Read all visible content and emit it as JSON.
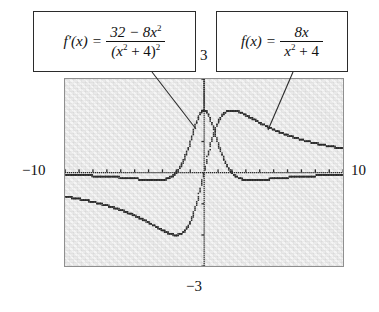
{
  "figure": {
    "background_color": "#ffffff",
    "plot_background_color": "#e9e9e9",
    "plot_border_color": "#8f8f8f",
    "curve_color": "#2b2b2b",
    "callout_border_color": "#2b2b2b"
  },
  "callouts": {
    "fprime": {
      "lhs": "f′(x)",
      "equals": "=",
      "numerator_pre": "32 − 8x",
      "numerator_exp": "2",
      "denominator_open": "(x",
      "denominator_exp_inner": "2",
      "denominator_mid": " + 4)",
      "denominator_exp_outer": "2",
      "plain_text": "f′(x) = (32 − 8x²) / (x² + 4)²"
    },
    "f": {
      "lhs": "f(x)",
      "equals": "=",
      "numerator_pre": "8x",
      "denominator_open": "x",
      "denominator_exp_inner": "2",
      "denominator_mid": " + 4",
      "plain_text": "f(x) = 8x / (x² + 4)"
    }
  },
  "axis_labels": {
    "ymax": "3",
    "xmin": "−10",
    "xmax": "10",
    "ymin": "−3"
  },
  "chart_data": {
    "type": "line",
    "title": "",
    "subtitle": "",
    "xlabel": "",
    "ylabel": "",
    "xlim": [
      -10,
      10
    ],
    "ylim": [
      -3,
      3
    ],
    "grid": false,
    "legend_position": "callout-boxes",
    "axes_style": "dotted-graphing-calculator",
    "x_axis_ticks_interval": 1,
    "y_axis_ticks_interval": 1,
    "annotations": [
      "f′(x) = (32 − 8x²)/(x² + 4)²",
      "f(x) = 8x/(x² + 4)"
    ],
    "series": [
      {
        "name": "f(x) = 8x/(x^2 + 4)",
        "formula": "8*x/(x*x+4)",
        "style": "dotted",
        "color": "#2b2b2b",
        "key_points": {
          "maximum": {
            "x": 2,
            "y": 2
          },
          "minimum": {
            "x": -2,
            "y": -2
          },
          "zero": {
            "x": 0,
            "y": 0
          }
        },
        "x": [
          -10,
          -9,
          -8,
          -7,
          -6,
          -5,
          -4,
          -3,
          -2,
          -1,
          0,
          1,
          2,
          3,
          4,
          5,
          6,
          7,
          8,
          9,
          10
        ],
        "values": [
          -0.769,
          -0.847,
          -0.941,
          -1.057,
          -1.2,
          -1.379,
          -1.6,
          -1.846,
          -2.0,
          -1.6,
          0.0,
          1.6,
          2.0,
          1.846,
          1.6,
          1.379,
          1.2,
          1.057,
          0.941,
          0.847,
          0.769
        ]
      },
      {
        "name": "f'(x) = (32 - 8x^2)/(x^2 + 4)^2",
        "formula": "(32-8*x*x)/((x*x+4)*(x*x+4))",
        "style": "dotted",
        "color": "#2b2b2b",
        "key_points": {
          "maximum": {
            "x": 0,
            "y": 2
          },
          "zeros": [
            {
              "x": -2,
              "y": 0
            },
            {
              "x": 2,
              "y": 0
            }
          ]
        },
        "x": [
          -10,
          -9,
          -8,
          -7,
          -6,
          -5,
          -4,
          -3,
          -2,
          -1,
          0,
          1,
          2,
          3,
          4,
          5,
          6,
          7,
          8,
          9,
          10
        ],
        "values": [
          -0.0709,
          -0.0848,
          -0.1049,
          -0.1346,
          -0.18,
          -0.2509,
          -0.36,
          -0.5041,
          -0.5,
          0.48,
          2.0,
          0.48,
          -0.5,
          -0.5041,
          -0.36,
          -0.2509,
          -0.18,
          -0.1346,
          -0.1049,
          -0.0848,
          -0.0709
        ]
      }
    ]
  }
}
